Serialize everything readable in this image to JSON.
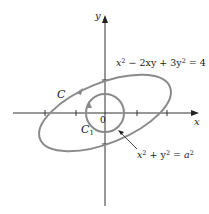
{
  "diagram": {
    "axes": {
      "x_label": "x",
      "y_label": "y",
      "origin_label": "0"
    },
    "curves": {
      "ellipse": {
        "label": "C",
        "equation_parts": [
          "x",
          "2",
          " − 2xy + 3y",
          "2",
          " = 4"
        ],
        "equation_text": "x² − 2xy + 3y² = 4",
        "orientation": "counterclockwise"
      },
      "circle": {
        "label": "C",
        "label_subscript": "1",
        "equation_parts": [
          "x",
          "2",
          " + y",
          "2",
          " = ",
          "a",
          "2"
        ],
        "equation_text": "x² + y² = a²",
        "orientation": "clockwise"
      }
    },
    "colors": {
      "curve_stroke": "#8a8a8a",
      "axis_stroke": "#333333",
      "text": "#222222"
    }
  }
}
